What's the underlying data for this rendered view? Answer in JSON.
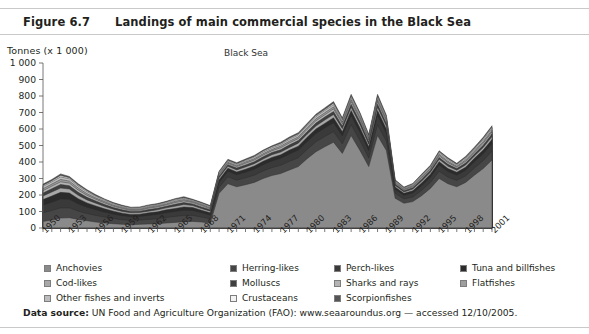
{
  "header": {
    "figure_number": "Figure 6.7",
    "title": "Landings of main commercial species in the Black Sea"
  },
  "footer": {
    "label": "Data source:",
    "text": " UN Food and Agriculture Organization (FAO): www.seaaroundus.org — accessed 12/10/2005."
  },
  "chart_data": {
    "type": "area",
    "stacked": true,
    "title": "Black Sea",
    "ylabel": "Tonnes (x 1 000)",
    "xlabel": "",
    "ylim": [
      0,
      1000
    ],
    "ytick_step": 100,
    "ytick_labels": [
      "0",
      "100",
      "200",
      "300",
      "400",
      "500",
      "600",
      "700",
      "800",
      "900",
      "1 000"
    ],
    "grid": false,
    "legend_position": "below",
    "xlim": [
      1950,
      2001
    ],
    "xtick_label_step": 3,
    "xtick_labels": [
      "1950",
      "1953",
      "1956",
      "1959",
      "1962",
      "1965",
      "1968",
      "1971",
      "1974",
      "1977",
      "1980",
      "1983",
      "1986",
      "1989",
      "1992",
      "1995",
      "1998",
      "2001"
    ],
    "x": [
      1950,
      1951,
      1952,
      1953,
      1954,
      1955,
      1956,
      1957,
      1958,
      1959,
      1960,
      1961,
      1962,
      1963,
      1964,
      1965,
      1966,
      1967,
      1968,
      1969,
      1970,
      1971,
      1972,
      1973,
      1974,
      1975,
      1976,
      1977,
      1978,
      1979,
      1980,
      1981,
      1982,
      1983,
      1984,
      1985,
      1986,
      1987,
      1988,
      1989,
      1990,
      1991,
      1992,
      1993,
      1994,
      1995,
      1996,
      1997,
      1998,
      1999,
      2000,
      2001
    ],
    "series": [
      {
        "name": "Anchovies",
        "color": "#8a8a8a",
        "values": [
          40,
          48,
          60,
          62,
          52,
          44,
          36,
          30,
          26,
          22,
          20,
          22,
          24,
          26,
          30,
          34,
          38,
          40,
          36,
          30,
          210,
          268,
          250,
          262,
          276,
          300,
          318,
          330,
          352,
          372,
          420,
          462,
          492,
          520,
          452,
          560,
          470,
          372,
          560,
          470,
          180,
          150,
          160,
          196,
          240,
          300,
          268,
          250,
          276,
          320,
          360,
          412
        ]
      },
      {
        "name": "Herring-likes",
        "color": "#464646",
        "values": [
          52,
          58,
          62,
          60,
          50,
          44,
          40,
          36,
          32,
          28,
          26,
          26,
          28,
          30,
          34,
          36,
          38,
          36,
          30,
          26,
          36,
          42,
          40,
          42,
          44,
          46,
          48,
          50,
          52,
          54,
          56,
          60,
          62,
          64,
          58,
          66,
          60,
          52,
          66,
          56,
          30,
          26,
          28,
          32,
          36,
          44,
          40,
          38,
          40,
          44,
          48,
          54
        ]
      },
      {
        "name": "Perch-likes",
        "color": "#3a3a3a",
        "values": [
          46,
          50,
          54,
          52,
          44,
          38,
          34,
          30,
          26,
          24,
          22,
          22,
          24,
          26,
          28,
          30,
          32,
          30,
          26,
          22,
          30,
          34,
          32,
          34,
          36,
          38,
          40,
          42,
          44,
          46,
          48,
          50,
          52,
          54,
          48,
          56,
          50,
          44,
          56,
          48,
          24,
          22,
          24,
          28,
          32,
          38,
          34,
          32,
          34,
          38,
          42,
          46
        ]
      },
      {
        "name": "Tuna and billfishes",
        "color": "#2b2b2b",
        "values": [
          34,
          38,
          40,
          38,
          32,
          26,
          24,
          20,
          18,
          16,
          14,
          14,
          16,
          16,
          18,
          18,
          20,
          18,
          16,
          14,
          16,
          18,
          18,
          18,
          20,
          20,
          22,
          22,
          24,
          24,
          26,
          28,
          28,
          30,
          26,
          30,
          28,
          24,
          30,
          26,
          14,
          12,
          14,
          16,
          18,
          20,
          18,
          18,
          18,
          20,
          22,
          24
        ]
      },
      {
        "name": "Cod-likes",
        "color": "#a8a8a8",
        "values": [
          22,
          24,
          26,
          24,
          20,
          18,
          16,
          14,
          12,
          10,
          10,
          10,
          10,
          12,
          12,
          14,
          14,
          12,
          10,
          10,
          12,
          12,
          12,
          14,
          14,
          14,
          16,
          16,
          16,
          18,
          18,
          18,
          20,
          20,
          18,
          20,
          20,
          16,
          20,
          18,
          10,
          8,
          10,
          12,
          12,
          14,
          14,
          12,
          14,
          14,
          16,
          18
        ]
      },
      {
        "name": "Molluscs",
        "color": "#3f3f3f",
        "values": [
          18,
          20,
          22,
          20,
          18,
          16,
          14,
          12,
          10,
          10,
          8,
          8,
          10,
          10,
          10,
          12,
          12,
          10,
          10,
          8,
          10,
          10,
          12,
          12,
          12,
          14,
          14,
          14,
          16,
          16,
          16,
          18,
          18,
          18,
          16,
          18,
          18,
          14,
          18,
          16,
          8,
          8,
          8,
          10,
          10,
          12,
          12,
          10,
          12,
          12,
          14,
          16
        ]
      },
      {
        "name": "Sharks and rays",
        "color": "#b4b4b4",
        "values": [
          14,
          16,
          16,
          16,
          14,
          12,
          10,
          10,
          8,
          8,
          6,
          6,
          8,
          8,
          8,
          10,
          10,
          8,
          8,
          6,
          8,
          8,
          8,
          10,
          10,
          10,
          10,
          12,
          12,
          12,
          14,
          14,
          14,
          16,
          14,
          16,
          14,
          12,
          16,
          14,
          6,
          6,
          6,
          8,
          8,
          10,
          10,
          8,
          10,
          10,
          12,
          12
        ]
      },
      {
        "name": "Flatfishes",
        "color": "#9e9e9e",
        "values": [
          12,
          12,
          14,
          12,
          12,
          10,
          8,
          8,
          6,
          6,
          6,
          6,
          6,
          6,
          6,
          8,
          8,
          6,
          6,
          6,
          6,
          6,
          6,
          8,
          8,
          8,
          8,
          10,
          10,
          10,
          10,
          12,
          12,
          12,
          10,
          12,
          12,
          10,
          12,
          10,
          6,
          4,
          6,
          6,
          6,
          8,
          8,
          6,
          8,
          8,
          10,
          10
        ]
      },
      {
        "name": "Other fishes and inverts",
        "color": "#bdbdbd",
        "values": [
          14,
          14,
          16,
          14,
          12,
          12,
          10,
          8,
          8,
          6,
          6,
          6,
          6,
          6,
          8,
          8,
          8,
          6,
          6,
          6,
          8,
          8,
          8,
          8,
          10,
          10,
          10,
          10,
          12,
          12,
          12,
          14,
          14,
          14,
          12,
          14,
          14,
          10,
          14,
          12,
          6,
          6,
          6,
          8,
          8,
          10,
          10,
          8,
          10,
          10,
          12,
          12
        ]
      },
      {
        "name": "Crustaceans",
        "color": "#f2f2f2",
        "values": [
          6,
          6,
          8,
          6,
          6,
          6,
          4,
          4,
          4,
          4,
          4,
          4,
          4,
          4,
          4,
          4,
          4,
          4,
          4,
          4,
          4,
          4,
          4,
          4,
          4,
          6,
          6,
          6,
          6,
          6,
          6,
          6,
          6,
          8,
          6,
          8,
          6,
          6,
          8,
          6,
          4,
          2,
          4,
          4,
          4,
          6,
          6,
          4,
          6,
          6,
          6,
          8
        ]
      },
      {
        "name": "Scorpionfishes",
        "color": "#555555",
        "values": [
          8,
          8,
          10,
          8,
          8,
          6,
          6,
          4,
          4,
          4,
          4,
          4,
          4,
          4,
          4,
          4,
          6,
          4,
          4,
          4,
          4,
          6,
          6,
          6,
          6,
          6,
          6,
          8,
          8,
          8,
          8,
          8,
          10,
          10,
          8,
          10,
          8,
          8,
          10,
          8,
          4,
          4,
          4,
          6,
          6,
          6,
          6,
          6,
          6,
          8,
          8,
          8
        ]
      }
    ],
    "legend_layout": {
      "columns": 4,
      "rows": 3,
      "column_x": [
        0,
        186,
        290,
        416
      ],
      "row_y": [
        0,
        15,
        30
      ],
      "order": [
        [
          "Anchovies",
          "Herring-likes",
          "Perch-likes",
          "Tuna and billfishes"
        ],
        [
          "Cod-likes",
          "Molluscs",
          "Sharks and rays",
          "Flatfishes"
        ],
        [
          "Other fishes and inverts",
          "Crustaceans",
          "Scorpionfishes",
          null
        ]
      ]
    }
  }
}
